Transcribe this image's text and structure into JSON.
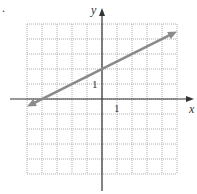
{
  "marker": ".",
  "chart_data": {
    "type": "line",
    "title": "",
    "xlabel": "x",
    "ylabel": "y",
    "xlim": [
      -5,
      5
    ],
    "ylim": [
      -5,
      5
    ],
    "grid": true,
    "grid_style": "dotted",
    "tick_labels": {
      "x": "1",
      "y": "1"
    },
    "series": [
      {
        "name": "line",
        "equation": "y = x/2 + 2",
        "slope": 0.5,
        "intercept": 2,
        "x_intercept": -4,
        "points": [
          [
            -5,
            -0.5
          ],
          [
            5,
            4.5
          ]
        ],
        "arrows": "both",
        "color": "#8a8a8a"
      }
    ],
    "legend": null
  }
}
